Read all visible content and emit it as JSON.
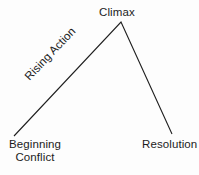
{
  "diagram": {
    "type": "plot-arc-diagram",
    "background_color": "#fdfdfd",
    "line_color": "#1f1f1f",
    "text_color": "#1c1c1c",
    "labels": {
      "climax": "Climax",
      "rising_action": "Rising Action",
      "beginning": "Beginning",
      "conflict": "Conflict",
      "resolution": "Resolution"
    },
    "points": {
      "start": {
        "x": 14,
        "y": 136
      },
      "apex": {
        "x": 121,
        "y": 22
      },
      "end": {
        "x": 172,
        "y": 134
      }
    },
    "rising_action_angle_deg": -46.5
  }
}
